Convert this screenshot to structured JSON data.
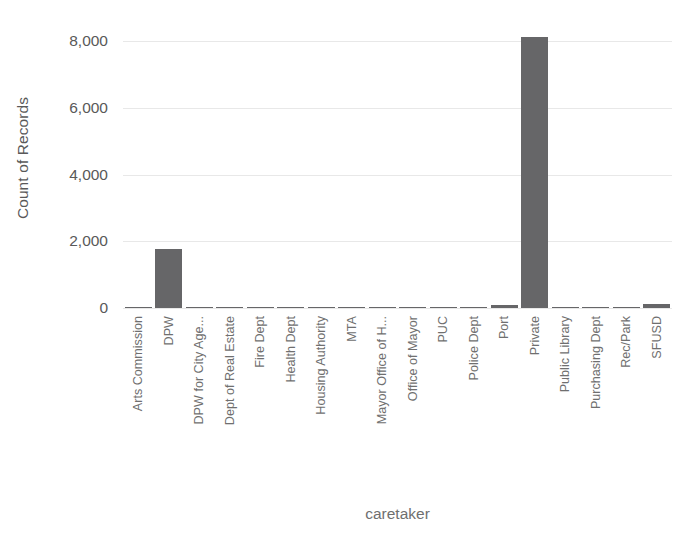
{
  "chart_data": {
    "type": "bar",
    "title": "",
    "xlabel": "caretaker",
    "ylabel": "Count of Records",
    "ylim": [
      0,
      8600
    ],
    "yticks": [
      0,
      2000,
      4000,
      6000,
      8000
    ],
    "ytick_labels": [
      "0",
      "2,000",
      "4,000",
      "6,000",
      "8,000"
    ],
    "grid": true,
    "legend": "none",
    "bar_color": "#666668",
    "gridline_color": "#e8e8e8",
    "axis_text_color": "#6f6f6f",
    "categories": [
      "Arts Commission",
      "DPW",
      "DPW for City Age...",
      "Dept of Real Estate",
      "Fire Dept",
      "Health Dept",
      "Housing Authority",
      "MTA",
      "Mayor Office of H...",
      "Office of Mayor",
      "PUC",
      "Police Dept",
      "Port",
      "Private",
      "Public Library",
      "Purchasing Dept",
      "Rec/Park",
      "SFUSD"
    ],
    "values": [
      8,
      1760,
      6,
      4,
      5,
      6,
      4,
      3,
      4,
      6,
      22,
      5,
      95,
      8120,
      5,
      4,
      45,
      110
    ]
  },
  "top_clipped_text": ""
}
